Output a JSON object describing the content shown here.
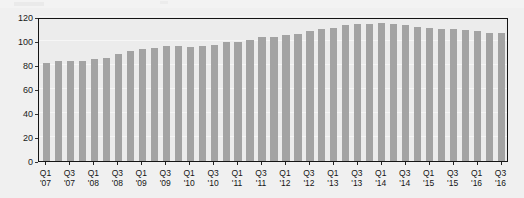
{
  "chart_data": {
    "type": "bar",
    "title": "",
    "subtitle": "",
    "xlabel": "",
    "ylabel": "",
    "ylim": [
      0,
      120
    ],
    "ytick_values": [
      0,
      20,
      40,
      60,
      80,
      100,
      120
    ],
    "ytick_labels": [
      "0",
      "20",
      "40",
      "60",
      "80",
      "100",
      "120"
    ],
    "grid": true,
    "legend": false,
    "legend_position": "none",
    "bar_color": "#a3a3a3",
    "plot_background": "#ececec",
    "page_background": "#f0f0f0",
    "axis_color": "#151515",
    "categories": [
      "Q1 '07",
      "Q2 '07",
      "Q3 '07",
      "Q4 '07",
      "Q1 '08",
      "Q2 '08",
      "Q3 '08",
      "Q4 '08",
      "Q1 '09",
      "Q2 '09",
      "Q3 '09",
      "Q4 '09",
      "Q1 '10",
      "Q2 '10",
      "Q3 '10",
      "Q4 '10",
      "Q1 '11",
      "Q2 '11",
      "Q3 '11",
      "Q4 '11",
      "Q1 '12",
      "Q2 '12",
      "Q3 '12",
      "Q4 '12",
      "Q1 '13",
      "Q2 '13",
      "Q3 '13",
      "Q4 '13",
      "Q1 '14",
      "Q2 '14",
      "Q3 '14",
      "Q4 '14",
      "Q1 '15",
      "Q2 '15",
      "Q3 '15",
      "Q4 '15",
      "Q1 '16",
      "Q2 '16",
      "Q3 '16"
    ],
    "values": [
      82,
      83,
      83,
      83,
      85,
      86,
      89,
      92,
      93,
      94,
      96,
      96,
      95,
      96,
      97,
      99,
      99,
      101,
      103,
      103,
      105,
      106,
      108,
      110,
      111,
      113,
      114,
      114,
      115,
      114,
      113,
      112,
      111,
      110,
      110,
      109,
      108,
      107,
      107
    ],
    "xtick_labels": [
      {
        "line1": "Q1",
        "line2": "'07",
        "index": 0
      },
      {
        "line1": "Q3",
        "line2": "'07",
        "index": 2
      },
      {
        "line1": "Q1",
        "line2": "'08",
        "index": 4
      },
      {
        "line1": "Q3",
        "line2": "'08",
        "index": 6
      },
      {
        "line1": "Q1",
        "line2": "'09",
        "index": 8
      },
      {
        "line1": "Q3",
        "line2": "'09",
        "index": 10
      },
      {
        "line1": "Q1",
        "line2": "'10",
        "index": 12
      },
      {
        "line1": "Q3",
        "line2": "'10",
        "index": 14
      },
      {
        "line1": "Q1",
        "line2": "'11",
        "index": 16
      },
      {
        "line1": "Q3",
        "line2": "'11",
        "index": 18
      },
      {
        "line1": "Q1",
        "line2": "'12",
        "index": 20
      },
      {
        "line1": "Q3",
        "line2": "'12",
        "index": 22
      },
      {
        "line1": "Q1",
        "line2": "'13",
        "index": 24
      },
      {
        "line1": "Q3",
        "line2": "'13",
        "index": 26
      },
      {
        "line1": "Q1",
        "line2": "'14",
        "index": 28
      },
      {
        "line1": "Q3",
        "line2": "'14",
        "index": 30
      },
      {
        "line1": "Q1",
        "line2": "'15",
        "index": 32
      },
      {
        "line1": "Q3",
        "line2": "'15",
        "index": 34
      },
      {
        "line1": "Q1",
        "line2": "'16",
        "index": 36
      },
      {
        "line1": "Q3",
        "line2": "'16",
        "index": 38
      }
    ]
  }
}
